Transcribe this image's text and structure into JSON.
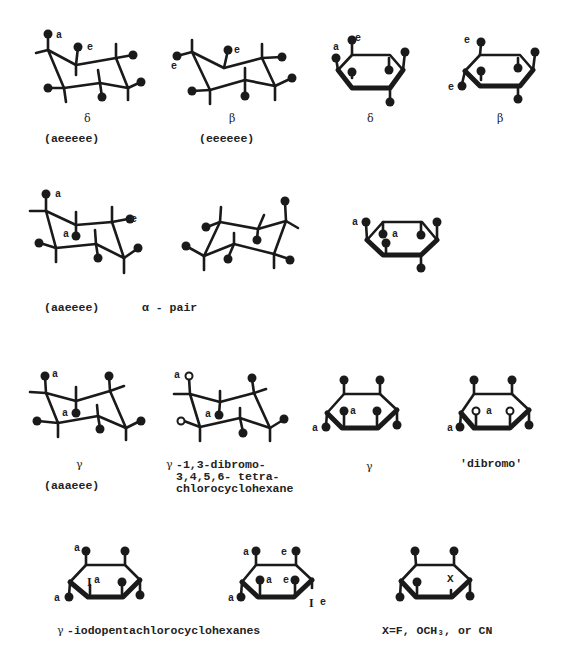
{
  "rows": [
    {
      "structures": [
        {
          "id": "delta-chair",
          "symbol": "δ",
          "config": "(aeeeee)",
          "annotations": [
            "a",
            "e"
          ]
        },
        {
          "id": "beta-chair",
          "symbol": "β",
          "config": "(eeeeee)",
          "annotations": [
            "e",
            "e"
          ]
        },
        {
          "id": "delta-haworth",
          "symbol": "δ",
          "annotations": [
            "a",
            "e"
          ]
        },
        {
          "id": "beta-haworth",
          "symbol": "β",
          "annotations": [
            "e",
            "e"
          ]
        }
      ]
    },
    {
      "structures": [
        {
          "id": "alpha-chair-1",
          "config": "(aaeeee)",
          "annotations": [
            "a",
            "a",
            "e"
          ]
        },
        {
          "id": "alpha-chair-2",
          "annotations": []
        },
        {
          "id": "alpha-haworth",
          "annotations": [
            "a",
            "a"
          ]
        }
      ],
      "caption": "α - pair"
    },
    {
      "structures": [
        {
          "id": "gamma-chair",
          "symbol": "γ",
          "config": "(aaaeee)",
          "annotations": [
            "a",
            "a"
          ]
        },
        {
          "id": "gamma-dibromo-chair",
          "symbol": "γ",
          "name_lines": [
            "-1,3-dibromo-",
            "3,4,5,6- tetra-",
            "chlorocyclohexane"
          ],
          "annotations": [
            "a",
            "a"
          ]
        },
        {
          "id": "gamma-haworth",
          "symbol": "γ",
          "annotations": [
            "a",
            "a"
          ]
        },
        {
          "id": "dibromo-haworth",
          "name": "'dibromo'",
          "annotations": [
            "a",
            "a"
          ]
        }
      ]
    },
    {
      "structures": [
        {
          "id": "iodo-haworth-1",
          "annotations": [
            "a",
            "I",
            "a",
            "a"
          ]
        },
        {
          "id": "iodo-haworth-2",
          "annotations": [
            "a",
            "e",
            "a",
            "e",
            "a",
            "I",
            "e"
          ]
        },
        {
          "id": "x-haworth",
          "annotations": [
            "X"
          ]
        }
      ],
      "captions": {
        "iodo": "-iodopentachlorocyclohexanes",
        "iodo_symbol": "γ",
        "x": "X=F, OCH₃, or CN"
      }
    }
  ],
  "colors": {
    "ink": "#1a1a1a",
    "paper": "#ffffff"
  }
}
